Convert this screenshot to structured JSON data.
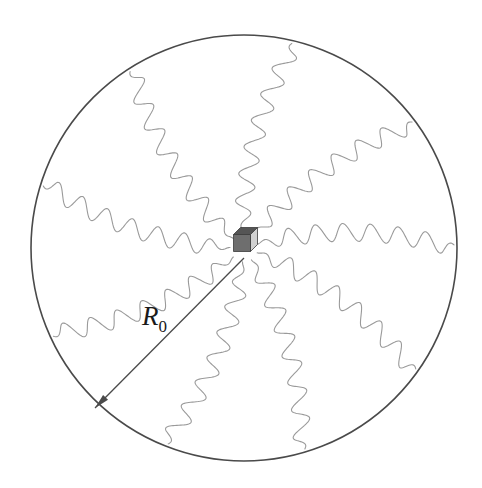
{
  "figure": {
    "background_color": "#ffffff"
  },
  "boundary_circle": {
    "name": "sphere-boundary",
    "center_x": 244,
    "center_y": 248,
    "radius": 213,
    "stroke_color": "#4a4a4a",
    "stroke_width": 1.6
  },
  "source_cube": {
    "name": "central-source-cube",
    "center_x": 242,
    "center_y": 243,
    "size": 17,
    "depth": 7,
    "face_front_color": "#6e6e6e",
    "face_top_color": "#555555",
    "face_right_color": "#d0d0d0",
    "outline_color": "#3b3b3b"
  },
  "waves": {
    "name": "radiating-waves",
    "count": 9,
    "stroke_color": "#9a9a9a",
    "stroke_width": 1.1,
    "amplitude": 9,
    "wavelength": 27,
    "curl_degrees": 16,
    "inner_radius": 14,
    "outer_radius": 210,
    "start_angles_deg": [
      268,
      308,
      344,
      20,
      58,
      96,
      140,
      182,
      222
    ]
  },
  "radius_arrow": {
    "name": "radius-indicator",
    "label": "R",
    "label_subscript": "0",
    "from_x": 244,
    "from_y": 258,
    "to_x": 95,
    "to_y": 408,
    "label_x": 142,
    "label_y": 325,
    "stroke_color": "#4a4a4a",
    "stroke_width": 1.3,
    "arrowhead_length": 15,
    "arrowhead_width": 7
  }
}
